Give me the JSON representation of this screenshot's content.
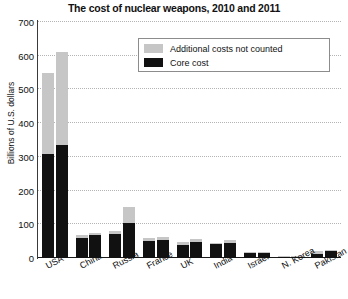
{
  "chart_data": {
    "type": "bar",
    "title": "The cost of nuclear weapons, 2010 and 2011",
    "xlabel": "",
    "ylabel": "Billions of U.S. dollars",
    "ylim": [
      0,
      700
    ],
    "yticks": [
      0,
      100,
      200,
      300,
      400,
      500,
      600,
      700
    ],
    "ytick_labels": [
      "0",
      "100",
      "200",
      "300",
      "400",
      "500",
      "600",
      "700"
    ],
    "grid": true,
    "stacked": true,
    "legend_position": "top-center",
    "categories": [
      "USA",
      "China",
      "Russia",
      "France",
      "UK",
      "India",
      "Israel",
      "N. Korea",
      "Pakistan"
    ],
    "bar_groups": [
      "2010",
      "2011"
    ],
    "segments": [
      {
        "name": "Core cost",
        "color": "#111111"
      },
      {
        "name": "Additional costs not counted",
        "color": "#c6c6c6"
      }
    ],
    "series": [
      {
        "name": "Core cost",
        "color": "#111111",
        "values_2010": [
          310,
          60,
          70,
          50,
          40,
          42,
          16,
          4,
          13
        ],
        "values_2011": [
          335,
          68,
          105,
          53,
          48,
          44,
          17,
          5,
          22
        ]
      },
      {
        "name": "Additional costs not counted",
        "color": "#c6c6c6",
        "values_2010": [
          240,
          8,
          10,
          8,
          7,
          2,
          1,
          1,
          8
        ],
        "values_2011": [
          275,
          7,
          45,
          9,
          9,
          8,
          1,
          1,
          2
        ]
      }
    ],
    "totals": {
      "values_2010": [
        550,
        68,
        80,
        58,
        47,
        44,
        17,
        5,
        21
      ],
      "values_2011": [
        610,
        75,
        150,
        62,
        57,
        52,
        18,
        6,
        24
      ]
    },
    "annotations": []
  },
  "legend": {
    "items": [
      {
        "label": "Additional costs not counted",
        "color": "#c6c6c6"
      },
      {
        "label": "Core cost",
        "color": "#111111"
      }
    ]
  }
}
